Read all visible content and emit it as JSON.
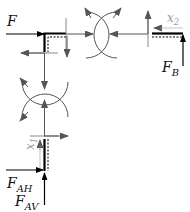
{
  "diagram": {
    "labels": {
      "F": "F",
      "FB_main": "F",
      "FB_sub": "B",
      "FAH_main": "F",
      "FAH_sub": "AH",
      "FAV_main": "F",
      "FAV_sub": "AV",
      "x1_main": "x",
      "x1_sub": "1",
      "x2_main": "x",
      "x2_sub": "2"
    },
    "colors": {
      "beam": "#000000",
      "force_arrow": "#000000",
      "internal_arrow": "#555555",
      "cut_line": "#8a8a8a",
      "coord_label": "#9a9a9a",
      "label": "#111111"
    }
  }
}
